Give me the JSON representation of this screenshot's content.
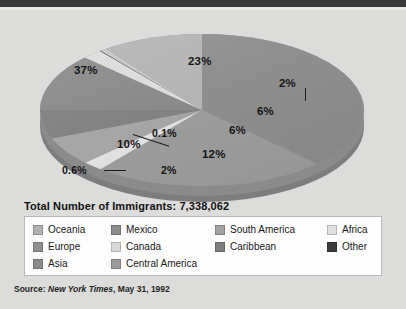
{
  "figure": {
    "title": "Total Number of Immigrants: 7,338,062",
    "source_prefix": "Source:",
    "source_italic": "New York Times",
    "source_rest": ", May 31, 1992"
  },
  "chart_data": {
    "type": "pie",
    "title": "Total Number of Immigrants: 7,338,062",
    "xlabel": "",
    "ylabel": "",
    "total": "7,338,062",
    "total_label": "Total Number of Immigrants",
    "legend_position": "bottom",
    "grid": false,
    "categories": [
      "Asia",
      "Europe",
      "Mexico",
      "Central America",
      "South America",
      "Caribbean",
      "Africa",
      "Canada",
      "Oceania",
      "Other"
    ],
    "values": [
      37,
      23,
      12,
      10,
      6,
      6,
      2,
      2,
      0.6,
      0.1
    ],
    "value_labels": [
      "37%",
      "23%",
      "12%",
      "10%",
      "6%",
      "6%",
      "2%",
      "2%",
      "0.6%",
      "0.1%"
    ],
    "colors": [
      "#8e8e8e",
      "#9d9d9d",
      "#8a8a8a",
      "#b4b4b4",
      "#a6a6a6",
      "#828282",
      "#e2e2e2",
      "#dcdcda",
      "#c6c6c6",
      "#2f2f2f"
    ],
    "slices": [
      {
        "name": "Asia",
        "label": "37%",
        "value": 37,
        "color": "#8e8e8e"
      },
      {
        "name": "Europe",
        "label": "23%",
        "value": 23,
        "color": "#9d9d9d"
      },
      {
        "name": "Africa",
        "label": "2%",
        "value": 2,
        "color": "#e2e2e2"
      },
      {
        "name": "South America",
        "label": "6%",
        "value": 6,
        "color": "#a6a6a6"
      },
      {
        "name": "Caribbean",
        "label": "6%",
        "value": 6,
        "color": "#828282"
      },
      {
        "name": "Mexico",
        "label": "12%",
        "value": 12,
        "color": "#8a8a8a"
      },
      {
        "name": "Canada",
        "label": "2%",
        "value": 2,
        "color": "#dcdcda"
      },
      {
        "name": "Other",
        "label": "0.1%",
        "value": 0.1,
        "color": "#2f2f2f"
      },
      {
        "name": "Oceania",
        "label": "0.6%",
        "value": 0.6,
        "color": "#c6c6c6"
      },
      {
        "name": "Central America",
        "label": "10%",
        "value": 10,
        "color": "#b4b4b4"
      }
    ]
  },
  "legend": {
    "items": [
      {
        "label": "Oceania",
        "color": "#b0b0b0",
        "col": 1,
        "row": 1
      },
      {
        "label": "Europe",
        "color": "#8f8f8f",
        "col": 1,
        "row": 2
      },
      {
        "label": "Asia",
        "color": "#8a8a8a",
        "col": 1,
        "row": 3
      },
      {
        "label": "Mexico",
        "color": "#8c8c8c",
        "col": 2,
        "row": 1
      },
      {
        "label": "Canada",
        "color": "#d8d8d8",
        "col": 2,
        "row": 2
      },
      {
        "label": "Central America",
        "color": "#9a9a9a",
        "col": 2,
        "row": 3
      },
      {
        "label": "South America",
        "color": "#a2a2a2",
        "col": 3,
        "row": 1
      },
      {
        "label": "Caribbean",
        "color": "#7e7e7e",
        "col": 3,
        "row": 2
      },
      {
        "label": "Africa",
        "color": "#e0e0e0",
        "col": 4,
        "row": 1
      },
      {
        "label": "Other",
        "color": "#3a3a3a",
        "col": 4,
        "row": 2
      }
    ]
  },
  "colors": {
    "page_background": "#dcdcda",
    "top_band": "#3a3a3a",
    "legend_background": "#fdfdfd",
    "legend_border": "#b9b9b7",
    "text": "#141414"
  }
}
